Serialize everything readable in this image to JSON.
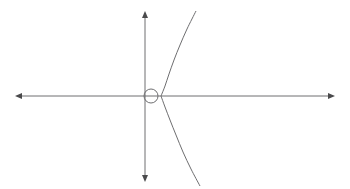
{
  "figure": {
    "background_color": "#ffffff",
    "width": 350,
    "height": 189,
    "line_color": "#6e6e70",
    "arrow_color": "#4a4a4c"
  },
  "chart_data": {
    "type": "line",
    "title": "",
    "subtitle": "",
    "xlabel": "",
    "ylabel": "",
    "grid": false,
    "legend": null,
    "axes": {
      "origin": {
        "x": 151,
        "y": 96
      },
      "x_axis": {
        "label": "",
        "from": {
          "x": 16,
          "y": 96
        },
        "to": {
          "x": 334,
          "y": 96
        },
        "arrow_start": true,
        "arrow_end": true
      },
      "y_axis": {
        "label": "",
        "from": {
          "x": 145,
          "y": 181
        },
        "to": {
          "x": 145,
          "y": 12
        },
        "arrow_start": true,
        "arrow_end": true
      }
    },
    "annotations": [
      {
        "name": "origin-circle",
        "shape": "circle",
        "cx": 151,
        "cy": 96,
        "r": 7,
        "filled": false
      }
    ],
    "series": [
      {
        "name": "curve-upper-branch",
        "points": [
          {
            "x": 161,
            "y": 96
          },
          {
            "x": 165,
            "y": 86
          },
          {
            "x": 169,
            "y": 74
          },
          {
            "x": 174,
            "y": 60
          },
          {
            "x": 180,
            "y": 45
          },
          {
            "x": 187,
            "y": 29
          },
          {
            "x": 196,
            "y": 11
          }
        ]
      },
      {
        "name": "curve-lower-branch",
        "points": [
          {
            "x": 161,
            "y": 96
          },
          {
            "x": 165,
            "y": 107
          },
          {
            "x": 170,
            "y": 120
          },
          {
            "x": 176,
            "y": 135
          },
          {
            "x": 183,
            "y": 152
          },
          {
            "x": 191,
            "y": 169
          },
          {
            "x": 200,
            "y": 186
          }
        ]
      }
    ],
    "x": [
      161,
      165,
      169,
      174,
      180,
      187,
      196
    ],
    "xlim": [
      16,
      334
    ],
    "ylim": [
      11,
      186
    ]
  }
}
